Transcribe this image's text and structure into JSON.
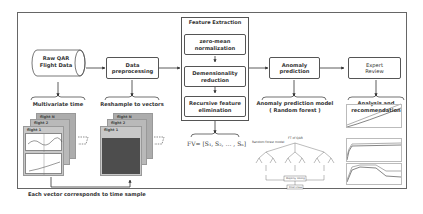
{
  "diagram": {
    "nodes": {
      "raw_data": "Raw QAR\nFlight Data",
      "preprocessing": "Data\npreprocessing",
      "feature_extraction_title": "Feature Extraction",
      "zero_mean": "zero-mean\nnormalization",
      "dim_reduction": "Demensionality\nreduction",
      "rfe": "Recursive feature\nelimination",
      "anomaly_prediction": "Anomaly\nprediction",
      "expert_review": "Expert\nReview"
    },
    "labels": {
      "multivariate": "Multivariate time",
      "reshample": "Reshample to vectors",
      "fv_formula": "FV= [S₁, S₂, … , Sₙ]",
      "model": "Anomaly prediction model\n( Random forest )",
      "analysis": "Analysis and\nrecommendation",
      "footer": "Each vector corresponds to time sample",
      "rf_input": "FT of QAR",
      "rf_sub": "Random forest model",
      "rf_vote": "Majority Voting",
      "rf_final": "Final Class"
    },
    "cards": {
      "flight_n": "flight N",
      "flight_2": "flight 2",
      "flight_1": "flight 1"
    }
  }
}
